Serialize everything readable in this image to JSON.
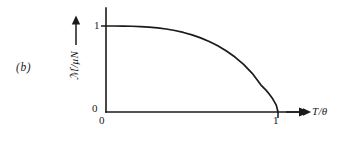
{
  "figure": {
    "panel_label": "(b)",
    "background_color": "#ffffff",
    "line_color": "#1a1a1a"
  },
  "axes": {
    "y": {
      "label": "ℳ/μN",
      "label_arrow": "arrow-up",
      "ticks": [
        {
          "value": 0,
          "text": "0"
        },
        {
          "value": 1,
          "text": "1"
        }
      ],
      "range": [
        0,
        1.08
      ],
      "has_arrowhead": false
    },
    "x": {
      "label": "T/θ",
      "label_arrow": "arrow-right",
      "ticks": [
        {
          "value": 0,
          "text": "0"
        },
        {
          "value": 1,
          "text": "1"
        }
      ],
      "range": [
        0,
        1.18
      ],
      "has_arrowhead": true
    }
  },
  "chart_data": {
    "type": "line",
    "title": "",
    "subtitle": "",
    "xlabel": "T/θ",
    "ylabel": "ℳ/μN",
    "xlim": [
      0,
      1.18
    ],
    "ylim": [
      0,
      1.08
    ],
    "xticks": [
      0,
      1
    ],
    "xticklabels": [
      "0",
      "1"
    ],
    "yticks": [
      0,
      1
    ],
    "yticklabels": [
      "0",
      "1"
    ],
    "grid": false,
    "legend": null,
    "annotations": [
      {
        "text": "(b)",
        "position": "left-of-axes"
      }
    ],
    "series": [
      {
        "name": "spontaneous magnetization",
        "color": "#1a1a1a",
        "x": [
          0.0,
          0.05,
          0.1,
          0.15,
          0.2,
          0.25,
          0.3,
          0.35,
          0.4,
          0.45,
          0.5,
          0.55,
          0.6,
          0.65,
          0.7,
          0.75,
          0.8,
          0.85,
          0.9,
          0.93,
          0.95,
          0.97,
          0.99,
          1.0
        ],
        "y": [
          1.0,
          1.0,
          0.999,
          0.997,
          0.993,
          0.987,
          0.978,
          0.965,
          0.948,
          0.925,
          0.897,
          0.862,
          0.82,
          0.77,
          0.71,
          0.639,
          0.554,
          0.45,
          0.316,
          0.254,
          0.207,
          0.15,
          0.08,
          0.0
        ]
      }
    ]
  }
}
